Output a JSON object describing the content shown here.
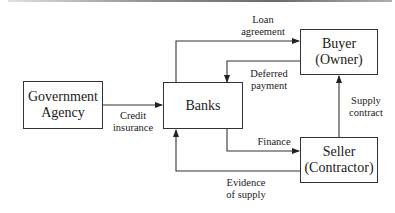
{
  "diagram": {
    "type": "flow",
    "nodes": [
      {
        "id": "government",
        "line1": "Government",
        "line2": "Agency"
      },
      {
        "id": "banks",
        "line1": "Banks",
        "line2": ""
      },
      {
        "id": "buyer",
        "line1": "Buyer",
        "line2": "(Owner)"
      },
      {
        "id": "seller",
        "line1": "Seller",
        "line2": "(Contractor)"
      }
    ],
    "edges": [
      {
        "id": "loan",
        "from": "banks",
        "to": "buyer",
        "line1": "Loan",
        "line2": "agreement"
      },
      {
        "id": "deferred",
        "from": "buyer",
        "to": "banks",
        "line1": "Deferred",
        "line2": "payment"
      },
      {
        "id": "credit",
        "from": "government",
        "to": "banks",
        "line1": "Credit",
        "line2": "insurance"
      },
      {
        "id": "finance",
        "from": "banks",
        "to": "seller",
        "line1": "Finance",
        "line2": ""
      },
      {
        "id": "evidence",
        "from": "seller",
        "to": "banks",
        "line1": "Evidence",
        "line2": "of supply"
      },
      {
        "id": "supply",
        "from": "seller",
        "to": "buyer",
        "line1": "Supply",
        "line2": "contract"
      }
    ],
    "colors": {
      "stroke": "#333333",
      "text": "#1a1a1a",
      "background": "#ffffff"
    }
  }
}
